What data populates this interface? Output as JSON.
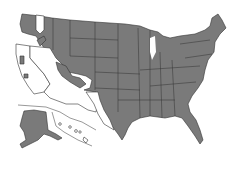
{
  "map": {
    "type": "choropleth-range-map",
    "region": "United States",
    "legend": [],
    "colors": {
      "shaded": "#7a7a7a",
      "unshaded": "#ffffff",
      "border": "#333333"
    },
    "shaded_regions": [
      "Eastern Washington (partial)",
      "Western Oregon (partial)",
      "Idaho",
      "Montana",
      "Wyoming",
      "North Dakota",
      "South Dakota",
      "Nebraska",
      "Kansas",
      "Oklahoma",
      "Texas (central/east)",
      "Colorado (partial)",
      "Utah (partial)",
      "Nevada (partial)",
      "Minnesota",
      "Iowa",
      "Missouri",
      "Arkansas",
      "Louisiana",
      "Wisconsin",
      "Illinois",
      "Michigan",
      "Indiana",
      "Ohio",
      "Kentucky",
      "Tennessee",
      "Mississippi",
      "Alabama",
      "Georgia",
      "Florida",
      "South Carolina",
      "North Carolina",
      "Virginia",
      "West Virginia",
      "Pennsylvania",
      "New York",
      "New England",
      "Alaska"
    ],
    "unshaded_regions": [
      "California",
      "Arizona",
      "New Mexico",
      "western Texas (partial)",
      "Hawaii",
      "parts of Washington/Oregon/Nevada"
    ]
  }
}
